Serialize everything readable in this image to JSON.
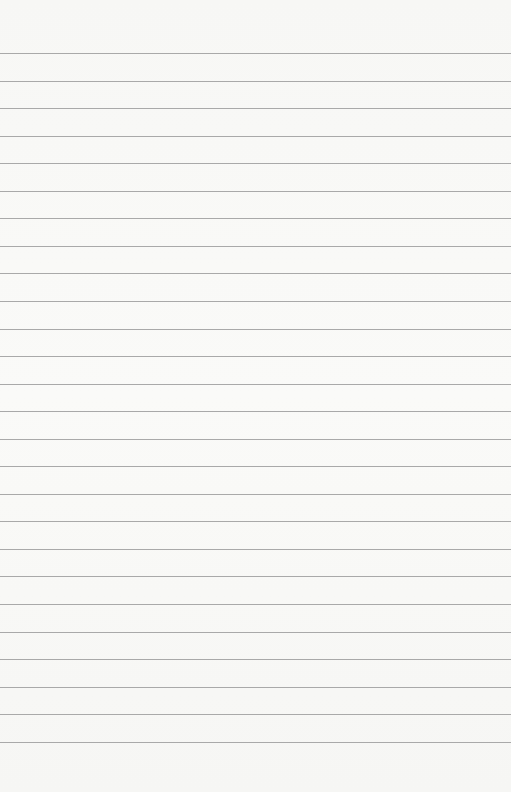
{
  "paper": {
    "background": "#f8f8f6",
    "rule_color": "#a9a9a9",
    "rule_count": 26,
    "first_rule_y": 53,
    "rule_spacing": 27.55
  }
}
